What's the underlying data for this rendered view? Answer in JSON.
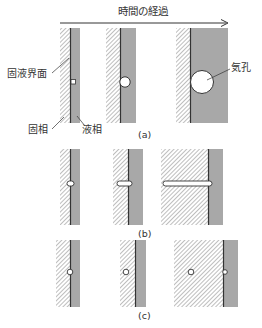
{
  "title": "時間の経過",
  "labels": {
    "interface": "固液界面",
    "solid": "固相",
    "liquid": "液相",
    "pore": "気孔"
  },
  "rows": [
    {
      "id": "a",
      "caption": "(a)"
    },
    {
      "id": "b",
      "caption": "(b)"
    },
    {
      "id": "c",
      "caption": "(c)"
    }
  ],
  "colors": {
    "liquid": "#a8a8a8",
    "hatch": "#8a8a8a",
    "interface": "#333333",
    "pore_fill": "#ffffff"
  }
}
